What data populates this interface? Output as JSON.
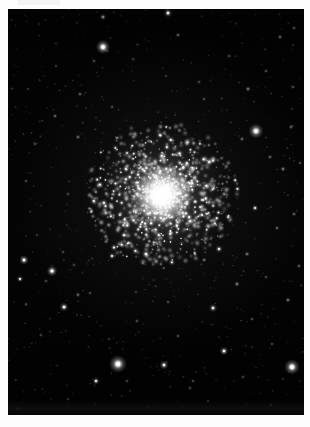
{
  "image": {
    "subject": "globular-star-cluster",
    "background_color": "#030303",
    "border_color": "#fdfdfd",
    "frame": {
      "x": 8,
      "y": 9,
      "width": 296,
      "height": 406
    },
    "canvas": {
      "width": 310,
      "height": 427
    }
  },
  "cluster": {
    "name": "globular-cluster",
    "center_x": 154,
    "center_y": 186,
    "core_radius": 16,
    "halo_radius": 72,
    "core_color": "#ffffff",
    "halo_color": "#d8d8d8",
    "member_star_count": 1700
  },
  "field_stars": [
    {
      "x": 95,
      "y": 8,
      "r": 1.1,
      "b": 0.55
    },
    {
      "x": 160,
      "y": 4,
      "r": 1.4,
      "b": 0.8
    },
    {
      "x": 170,
      "y": 26,
      "r": 0.9,
      "b": 0.4
    },
    {
      "x": 272,
      "y": 28,
      "r": 0.9,
      "b": 0.42
    },
    {
      "x": 95,
      "y": 38,
      "r": 2.4,
      "b": 1.0
    },
    {
      "x": 286,
      "y": 19,
      "r": 0.8,
      "b": 0.35
    },
    {
      "x": 48,
      "y": 57,
      "r": 0.7,
      "b": 0.3
    },
    {
      "x": 221,
      "y": 47,
      "r": 0.8,
      "b": 0.34
    },
    {
      "x": 86,
      "y": 52,
      "r": 0.8,
      "b": 0.33
    },
    {
      "x": 125,
      "y": 50,
      "r": 0.7,
      "b": 0.28
    },
    {
      "x": 258,
      "y": 62,
      "r": 0.8,
      "b": 0.36
    },
    {
      "x": 20,
      "y": 80,
      "r": 0.7,
      "b": 0.26
    },
    {
      "x": 72,
      "y": 85,
      "r": 0.9,
      "b": 0.4
    },
    {
      "x": 158,
      "y": 67,
      "r": 0.7,
      "b": 0.3
    },
    {
      "x": 191,
      "y": 73,
      "r": 0.8,
      "b": 0.33
    },
    {
      "x": 240,
      "y": 80,
      "r": 1.0,
      "b": 0.48
    },
    {
      "x": 285,
      "y": 78,
      "r": 0.8,
      "b": 0.34
    },
    {
      "x": 47,
      "y": 107,
      "r": 0.9,
      "b": 0.42
    },
    {
      "x": 104,
      "y": 98,
      "r": 0.8,
      "b": 0.32
    },
    {
      "x": 196,
      "y": 90,
      "r": 0.8,
      "b": 0.35
    },
    {
      "x": 248,
      "y": 122,
      "r": 2.5,
      "b": 1.0
    },
    {
      "x": 283,
      "y": 118,
      "r": 0.9,
      "b": 0.4
    },
    {
      "x": 234,
      "y": 130,
      "r": 0.9,
      "b": 0.44
    },
    {
      "x": 27,
      "y": 135,
      "r": 0.8,
      "b": 0.33
    },
    {
      "x": 70,
      "y": 128,
      "r": 0.9,
      "b": 0.45
    },
    {
      "x": 262,
      "y": 148,
      "r": 0.9,
      "b": 0.42
    },
    {
      "x": 275,
      "y": 160,
      "r": 1.0,
      "b": 0.5
    },
    {
      "x": 292,
      "y": 154,
      "r": 0.8,
      "b": 0.34
    },
    {
      "x": 18,
      "y": 172,
      "r": 0.8,
      "b": 0.32
    },
    {
      "x": 60,
      "y": 185,
      "r": 0.8,
      "b": 0.3
    },
    {
      "x": 83,
      "y": 200,
      "r": 0.8,
      "b": 0.33
    },
    {
      "x": 247,
      "y": 199,
      "r": 1.2,
      "b": 0.62
    },
    {
      "x": 286,
      "y": 205,
      "r": 0.9,
      "b": 0.42
    },
    {
      "x": 269,
      "y": 219,
      "r": 0.9,
      "b": 0.4
    },
    {
      "x": 29,
      "y": 226,
      "r": 0.7,
      "b": 0.27
    },
    {
      "x": 55,
      "y": 243,
      "r": 0.8,
      "b": 0.31
    },
    {
      "x": 239,
      "y": 245,
      "r": 1.0,
      "b": 0.46
    },
    {
      "x": 16,
      "y": 251,
      "r": 1.6,
      "b": 0.85
    },
    {
      "x": 44,
      "y": 262,
      "r": 1.8,
      "b": 0.92
    },
    {
      "x": 66,
      "y": 256,
      "r": 0.8,
      "b": 0.3
    },
    {
      "x": 104,
      "y": 247,
      "r": 1.2,
      "b": 0.62
    },
    {
      "x": 138,
      "y": 245,
      "r": 1.4,
      "b": 0.72
    },
    {
      "x": 196,
      "y": 251,
      "r": 0.9,
      "b": 0.42
    },
    {
      "x": 211,
      "y": 240,
      "r": 1.3,
      "b": 0.66
    },
    {
      "x": 291,
      "y": 257,
      "r": 0.9,
      "b": 0.38
    },
    {
      "x": 12,
      "y": 270,
      "r": 1.2,
      "b": 0.58
    },
    {
      "x": 38,
      "y": 272,
      "r": 0.8,
      "b": 0.3
    },
    {
      "x": 82,
      "y": 284,
      "r": 0.8,
      "b": 0.32
    },
    {
      "x": 229,
      "y": 275,
      "r": 1.0,
      "b": 0.5
    },
    {
      "x": 258,
      "y": 268,
      "r": 0.8,
      "b": 0.31
    },
    {
      "x": 128,
      "y": 283,
      "r": 0.7,
      "b": 0.26
    },
    {
      "x": 18,
      "y": 295,
      "r": 0.7,
      "b": 0.28
    },
    {
      "x": 70,
      "y": 286,
      "r": 0.9,
      "b": 0.38
    },
    {
      "x": 160,
      "y": 293,
      "r": 0.8,
      "b": 0.33
    },
    {
      "x": 205,
      "y": 299,
      "r": 1.4,
      "b": 0.72
    },
    {
      "x": 280,
      "y": 291,
      "r": 1.0,
      "b": 0.44
    },
    {
      "x": 56,
      "y": 298,
      "r": 1.5,
      "b": 0.8
    },
    {
      "x": 129,
      "y": 312,
      "r": 0.8,
      "b": 0.32
    },
    {
      "x": 244,
      "y": 310,
      "r": 0.8,
      "b": 0.33
    },
    {
      "x": 33,
      "y": 326,
      "r": 0.8,
      "b": 0.31
    },
    {
      "x": 101,
      "y": 330,
      "r": 0.7,
      "b": 0.26
    },
    {
      "x": 170,
      "y": 327,
      "r": 0.8,
      "b": 0.34
    },
    {
      "x": 216,
      "y": 342,
      "r": 1.5,
      "b": 0.78
    },
    {
      "x": 264,
      "y": 335,
      "r": 0.8,
      "b": 0.3
    },
    {
      "x": 110,
      "y": 355,
      "r": 3.0,
      "b": 1.0
    },
    {
      "x": 156,
      "y": 356,
      "r": 1.5,
      "b": 0.78
    },
    {
      "x": 284,
      "y": 358,
      "r": 2.6,
      "b": 1.0
    },
    {
      "x": 88,
      "y": 372,
      "r": 1.3,
      "b": 0.66
    },
    {
      "x": 119,
      "y": 372,
      "r": 0.8,
      "b": 0.3
    },
    {
      "x": 185,
      "y": 372,
      "r": 0.8,
      "b": 0.33
    },
    {
      "x": 235,
      "y": 368,
      "r": 0.8,
      "b": 0.31
    },
    {
      "x": 182,
      "y": 379,
      "r": 0.8,
      "b": 0.32
    },
    {
      "x": 60,
      "y": 390,
      "r": 0.7,
      "b": 0.27
    },
    {
      "x": 200,
      "y": 392,
      "r": 0.7,
      "b": 0.25
    },
    {
      "x": 10,
      "y": 400,
      "r": 1.0,
      "b": 0.48
    },
    {
      "x": 140,
      "y": 398,
      "r": 0.7,
      "b": 0.24
    },
    {
      "x": 263,
      "y": 396,
      "r": 0.7,
      "b": 0.26
    }
  ]
}
